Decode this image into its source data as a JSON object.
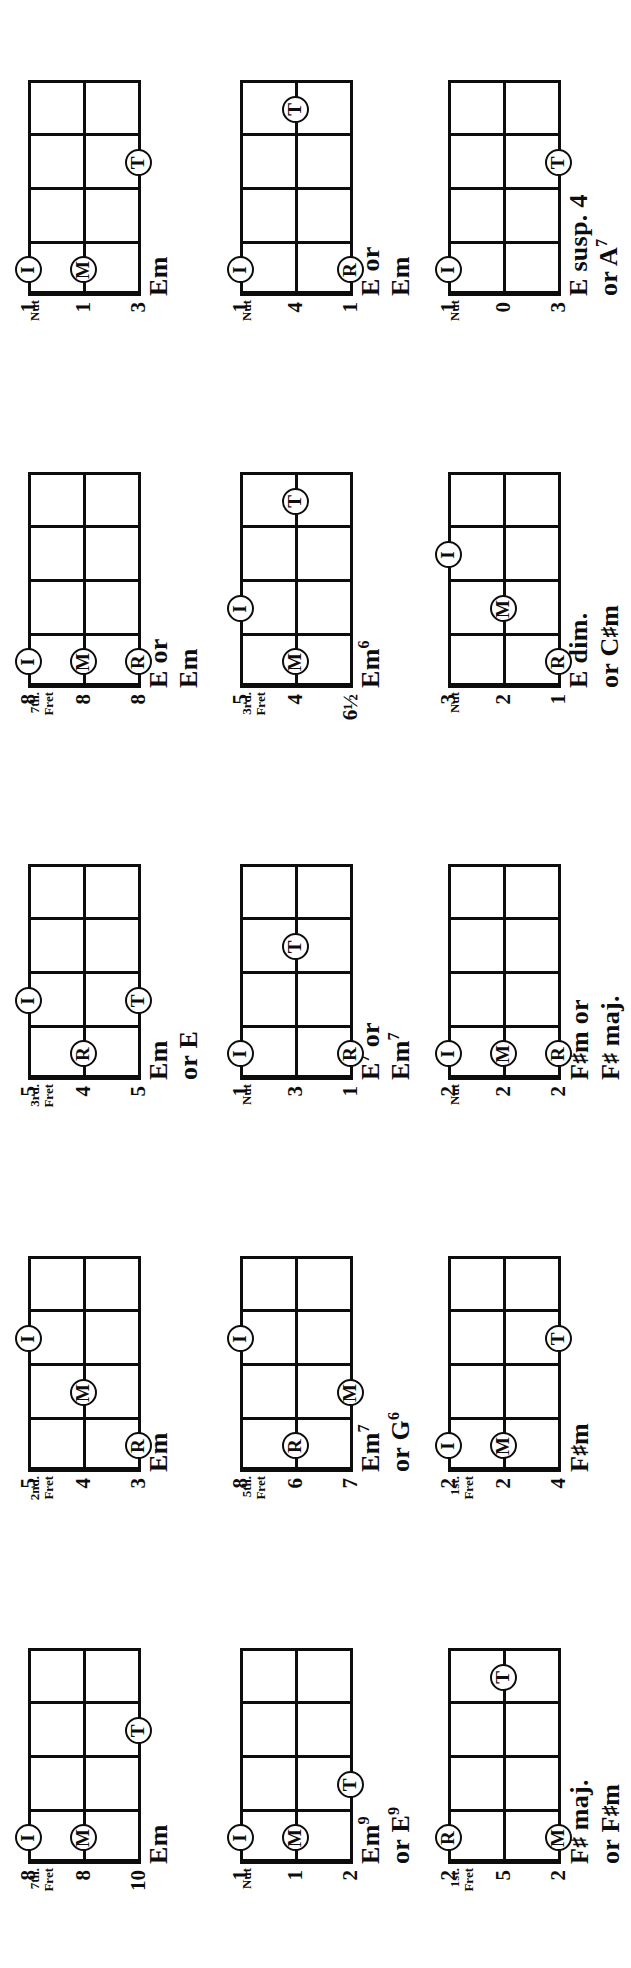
{
  "page": {
    "kind": "banjo-chord-chart",
    "orientation": "rotated-90-ccw",
    "ink_color": "#0d0d0d",
    "paper_color": "#ffffff",
    "strings": 3,
    "frets_shown": 4
  },
  "chords": [
    {
      "id": "em-7th",
      "name_lines": [
        "Em"
      ],
      "position_label": [
        "7th.",
        "Fret"
      ],
      "string_numbers": [
        "8",
        "8",
        "10"
      ],
      "markers": [
        {
          "label": "I",
          "string": 1,
          "fret": 1
        },
        {
          "label": "M",
          "string": 2,
          "fret": 1
        },
        {
          "label": "T",
          "string": 3,
          "fret": 3
        }
      ]
    },
    {
      "id": "em-2nd",
      "name_lines": [
        "Em"
      ],
      "position_label": [
        "2nd.",
        "Fret"
      ],
      "string_numbers": [
        "5",
        "4",
        "3"
      ],
      "markers": [
        {
          "label": "I",
          "string": 1,
          "fret": 3
        },
        {
          "label": "M",
          "string": 2,
          "fret": 2
        },
        {
          "label": "R",
          "string": 3,
          "fret": 1
        }
      ]
    },
    {
      "id": "em-or-e-3rd",
      "name_lines": [
        "Em",
        "or E"
      ],
      "position_label": [
        "3rd.",
        "Fret"
      ],
      "string_numbers": [
        "5",
        "4",
        "5"
      ],
      "markers": [
        {
          "label": "I",
          "string": 1,
          "fret": 2
        },
        {
          "label": "R",
          "string": 2,
          "fret": 1
        },
        {
          "label": "T",
          "string": 3,
          "fret": 2
        }
      ]
    },
    {
      "id": "e-or-em-7th",
      "name_lines": [
        "E or",
        "Em"
      ],
      "position_label": [
        "7th.",
        "Fret"
      ],
      "string_numbers": [
        "8",
        "8",
        "8"
      ],
      "markers": [
        {
          "label": "I",
          "string": 1,
          "fret": 1
        },
        {
          "label": "M",
          "string": 2,
          "fret": 1
        },
        {
          "label": "R",
          "string": 3,
          "fret": 1
        }
      ]
    },
    {
      "id": "em-nut",
      "name_lines": [
        "Em"
      ],
      "position_label": [
        "Nut"
      ],
      "string_numbers": [
        "1",
        "1",
        "3"
      ],
      "markers": [
        {
          "label": "I",
          "string": 1,
          "fret": 1
        },
        {
          "label": "M",
          "string": 2,
          "fret": 1
        },
        {
          "label": "T",
          "string": 3,
          "fret": 3
        }
      ]
    },
    {
      "id": "em9-or-e9",
      "name_lines": [
        "Em⁹",
        "or E⁹"
      ],
      "position_label": [
        "Nut"
      ],
      "string_numbers": [
        "1",
        "1",
        "2"
      ],
      "markers": [
        {
          "label": "I",
          "string": 1,
          "fret": 1
        },
        {
          "label": "M",
          "string": 2,
          "fret": 1
        },
        {
          "label": "T",
          "string": 3,
          "fret": 2
        }
      ]
    },
    {
      "id": "em7-or-g6",
      "name_lines": [
        "Em⁷",
        "or G⁶"
      ],
      "position_label": [
        "5th.",
        "Fret"
      ],
      "string_numbers": [
        "8",
        "6",
        "7"
      ],
      "markers": [
        {
          "label": "I",
          "string": 1,
          "fret": 3
        },
        {
          "label": "R",
          "string": 2,
          "fret": 1
        },
        {
          "label": "M",
          "string": 3,
          "fret": 2
        }
      ]
    },
    {
      "id": "e7-or-em7",
      "name_lines": [
        "E⁷ or",
        "Em⁷"
      ],
      "position_label": [
        "Nut"
      ],
      "string_numbers": [
        "1",
        "3",
        "1"
      ],
      "markers": [
        {
          "label": "I",
          "string": 1,
          "fret": 1
        },
        {
          "label": "R",
          "string": 3,
          "fret": 1
        },
        {
          "label": "T",
          "string": 2,
          "fret": 3
        }
      ]
    },
    {
      "id": "em6",
      "name_lines": [
        "Em⁶"
      ],
      "position_label": [
        "3rd.",
        "Fret"
      ],
      "string_numbers": [
        "5",
        "4",
        "6½"
      ],
      "markers": [
        {
          "label": "I",
          "string": 1,
          "fret": 2
        },
        {
          "label": "M",
          "string": 2,
          "fret": 1
        },
        {
          "label": "T",
          "string": 2,
          "fret": 4
        }
      ]
    },
    {
      "id": "e-or-em-nut",
      "name_lines": [
        "E or",
        "Em"
      ],
      "position_label": [
        "Nut"
      ],
      "string_numbers": [
        "1",
        "4",
        "1"
      ],
      "markers": [
        {
          "label": "I",
          "string": 1,
          "fret": 1
        },
        {
          "label": "R",
          "string": 3,
          "fret": 1
        },
        {
          "label": "T",
          "string": 2,
          "fret": 4
        }
      ]
    },
    {
      "id": "fsharp-maj-or-fsharpm",
      "name_lines": [
        "F♯ maj.",
        "or F♯m"
      ],
      "position_label": [
        "1st.",
        "Fret"
      ],
      "string_numbers": [
        "2",
        "5",
        "2"
      ],
      "markers": [
        {
          "label": "R",
          "string": 1,
          "fret": 1
        },
        {
          "label": "M",
          "string": 3,
          "fret": 1
        },
        {
          "label": "T",
          "string": 2,
          "fret": 4
        }
      ]
    },
    {
      "id": "fsharpm-1st",
      "name_lines": [
        "F♯m"
      ],
      "position_label": [
        "1st.",
        "Fret"
      ],
      "string_numbers": [
        "2",
        "2",
        "4"
      ],
      "markers": [
        {
          "label": "I",
          "string": 1,
          "fret": 1
        },
        {
          "label": "M",
          "string": 2,
          "fret": 1
        },
        {
          "label": "T",
          "string": 3,
          "fret": 3
        }
      ]
    },
    {
      "id": "fsharpm-or-fsharp-maj",
      "name_lines": [
        "F♯m or",
        "F♯ maj."
      ],
      "position_label": [
        "Nut"
      ],
      "string_numbers": [
        "2",
        "2",
        "2"
      ],
      "markers": [
        {
          "label": "I",
          "string": 1,
          "fret": 1
        },
        {
          "label": "M",
          "string": 2,
          "fret": 1
        },
        {
          "label": "R",
          "string": 3,
          "fret": 1
        }
      ]
    },
    {
      "id": "e-dim-or-csharpm",
      "name_lines": [
        "E dim.",
        "or C♯m"
      ],
      "position_label": [
        "Nut"
      ],
      "string_numbers": [
        "3",
        "2",
        "1"
      ],
      "markers": [
        {
          "label": "I",
          "string": 1,
          "fret": 3
        },
        {
          "label": "M",
          "string": 2,
          "fret": 2
        },
        {
          "label": "R",
          "string": 3,
          "fret": 1
        }
      ]
    },
    {
      "id": "e-susp4-or-a7",
      "name_lines": [
        "E susp. 4",
        "or A⁷"
      ],
      "position_label": [
        "Nut"
      ],
      "string_numbers": [
        "1",
        "0",
        "3"
      ],
      "markers": [
        {
          "label": "I",
          "string": 1,
          "fret": 1
        },
        {
          "label": "T",
          "string": 3,
          "fret": 3
        }
      ]
    }
  ],
  "grid": {
    "columns": 5,
    "rows": 3,
    "order": [
      [
        "em-7th",
        "em-2nd",
        "em-or-e-3rd",
        "e-or-em-7th",
        "em-nut"
      ],
      [
        "em9-or-e9",
        "em7-or-g6",
        "e7-or-em7",
        "em6",
        "e-or-em-nut"
      ],
      [
        "fsharp-maj-or-fsharpm",
        "fsharpm-1st",
        "fsharpm-or-fsharp-maj",
        "e-dim-or-csharpm",
        "e-susp4-or-a7"
      ]
    ]
  }
}
